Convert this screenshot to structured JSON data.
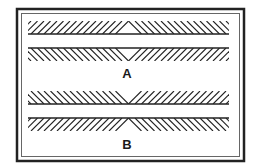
{
  "figure": {
    "type": "illusion-diagram",
    "panels": [
      {
        "label": "A",
        "top_hatch": "peak-up",
        "bottom_hatch": "peak-down"
      },
      {
        "label": "B",
        "top_hatch": "peak-down",
        "bottom_hatch": "peak-up"
      }
    ],
    "colors": {
      "ink": "#222222",
      "frame_inner": "#555555",
      "background": "#ffffff"
    }
  }
}
